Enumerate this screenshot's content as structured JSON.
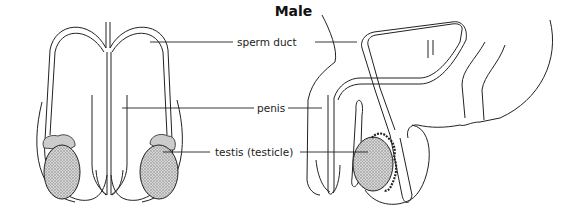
{
  "diagram": {
    "title": "Male",
    "labels": [
      {
        "id": "sperm-duct",
        "text": "sperm duct"
      },
      {
        "id": "penis",
        "text": "penis"
      },
      {
        "id": "testis",
        "text": "testis (testicle)"
      }
    ],
    "views": [
      "front view",
      "side view"
    ],
    "colors": {
      "line": "#222222",
      "testis_fill": "#b8b8b8",
      "background": "#ffffff"
    }
  }
}
